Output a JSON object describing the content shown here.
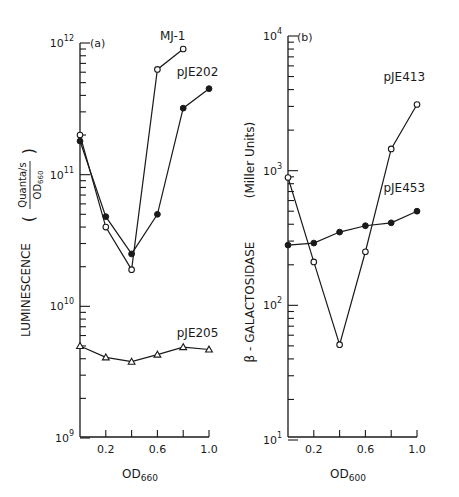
{
  "chart_data": [
    {
      "type": "line",
      "panel": "(a)",
      "title": "",
      "xlabel": "OD",
      "xlabel_sub": "660",
      "ylabel": "LUMINESCENCE",
      "ylabel_unit_num": "Quanta/s",
      "ylabel_unit_den": "OD",
      "ylabel_unit_den_sub": "660",
      "yscale": "log",
      "ylim": [
        1000000000.0,
        1000000000000.0
      ],
      "xlim": [
        0,
        1.0
      ],
      "x_ticks": [
        0.2,
        0.4,
        0.6,
        0.8,
        1.0
      ],
      "x_tick_labels": [
        {
          "value": 0.2,
          "label": "0.2"
        },
        {
          "value": 0.6,
          "label": "0.6"
        },
        {
          "value": 1.0,
          "label": "1.0"
        }
      ],
      "y_tick_labels": [
        {
          "exp": 12,
          "base": "10",
          "sup": "12"
        },
        {
          "exp": 11,
          "base": "10",
          "sup": "11"
        },
        {
          "exp": 10,
          "base": "10",
          "sup": "10"
        },
        {
          "exp": 9,
          "base": "10",
          "sup": "9"
        }
      ],
      "grid": false,
      "series": [
        {
          "name": "MJ-1",
          "marker": "open-circle",
          "x": [
            0,
            0.2,
            0.4,
            0.6,
            0.8
          ],
          "values": [
            200000000000.0,
            40000000000.0,
            19000000000.0,
            630000000000.0,
            900000000000.0
          ],
          "label_pos": {
            "x": 0.62,
            "y": 1050000000000.0
          }
        },
        {
          "name": "pJE202",
          "marker": "filled-circle",
          "x": [
            0,
            0.2,
            0.4,
            0.6,
            0.8,
            1.0
          ],
          "values": [
            180000000000.0,
            48000000000.0,
            25000000000.0,
            50000000000.0,
            320000000000.0,
            450000000000.0
          ],
          "label_pos": {
            "x": 0.75,
            "y": 560000000000.0
          }
        },
        {
          "name": "pJE205",
          "marker": "open-triangle",
          "x": [
            0,
            0.2,
            0.4,
            0.6,
            0.8,
            1.0
          ],
          "values": [
            5000000000.0,
            4100000000.0,
            3800000000.0,
            4300000000.0,
            4900000000.0,
            4700000000.0
          ],
          "label_pos": {
            "x": 0.75,
            "y": 5800000000.0
          }
        }
      ]
    },
    {
      "type": "line",
      "panel": "(b)",
      "title": "",
      "xlabel": "OD",
      "xlabel_sub": "600",
      "ylabel": "β - GALACTOSIDASE",
      "ylabel_unit": "(Miller Units)",
      "yscale": "log",
      "ylim": [
        10,
        10000
      ],
      "xlim": [
        0,
        1.0
      ],
      "x_ticks": [
        0.2,
        0.4,
        0.6,
        0.8,
        1.0
      ],
      "x_tick_labels": [
        {
          "value": 0.2,
          "label": "0.2"
        },
        {
          "value": 0.6,
          "label": "0.6"
        },
        {
          "value": 1.0,
          "label": "1.0"
        }
      ],
      "y_tick_labels": [
        {
          "exp": 4,
          "base": "10",
          "sup": "4"
        },
        {
          "exp": 3,
          "base": "10",
          "sup": "3"
        },
        {
          "exp": 2,
          "base": "10",
          "sup": "2"
        },
        {
          "exp": 1,
          "base": "10",
          "sup": "1"
        }
      ],
      "grid": false,
      "series": [
        {
          "name": "pJE413",
          "marker": "open-circle",
          "x": [
            0,
            0.2,
            0.4,
            0.6,
            0.8,
            1.0
          ],
          "values": [
            890,
            210,
            51,
            250,
            1450,
            3100
          ],
          "label_pos": {
            "x": 0.74,
            "y": 4600
          }
        },
        {
          "name": "pJE453",
          "marker": "filled-circle",
          "x": [
            0,
            0.2,
            0.4,
            0.6,
            0.8,
            1.0
          ],
          "values": [
            280,
            290,
            350,
            390,
            410,
            500
          ],
          "label_pos": {
            "x": 0.74,
            "y": 700
          }
        }
      ]
    }
  ]
}
